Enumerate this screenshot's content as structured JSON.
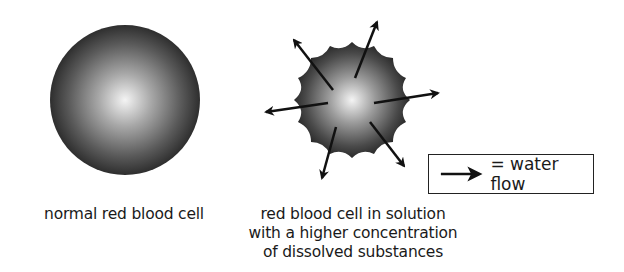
{
  "diagram": {
    "normal_cell": {
      "label": "normal red blood cell",
      "shape": "sphere",
      "center": [
        125,
        100
      ],
      "radius": 75
    },
    "crenated_cell": {
      "label_lines": [
        "red blood cell in solution",
        "with a higher concentration",
        "of dissolved substances"
      ],
      "shape": "crenated",
      "center": [
        352,
        100
      ],
      "radius": 60,
      "arrows": 6
    },
    "legend": {
      "symbol": "arrow-icon",
      "text": "= water flow"
    },
    "colors": {
      "cell_dark": "#2e2e2e",
      "cell_light": "#f2f2f2",
      "arrow": "#111111",
      "text": "#1a1a1a"
    }
  }
}
